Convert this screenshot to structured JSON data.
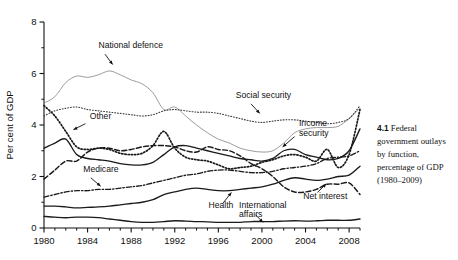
{
  "caption": {
    "number": "4.1",
    "text": "Federal government outlays by function, percentage of GDP (1980–2009)"
  },
  "chart_data": {
    "type": "line",
    "title": "",
    "xlabel": "",
    "ylabel": "Per cent of GDP",
    "xlim": [
      1980,
      2009
    ],
    "ylim": [
      0,
      8
    ],
    "grid": false,
    "legend": "inline-annotations",
    "xticks": [
      1980,
      1984,
      1988,
      1992,
      1996,
      2000,
      2004,
      2008
    ],
    "xtick_labels": [
      "1980",
      "1984",
      "1988",
      "1992",
      "1996",
      "2000",
      "2004",
      "2008"
    ],
    "xminor_ticks": [
      1981,
      1982,
      1983,
      1985,
      1986,
      1987,
      1989,
      1990,
      1991,
      1993,
      1994,
      1995,
      1997,
      1998,
      1999,
      2001,
      2002,
      2003,
      2005,
      2006,
      2007,
      2009
    ],
    "yticks": [
      0,
      2,
      4,
      6,
      8
    ],
    "ytick_labels": [
      "0",
      "2",
      "4",
      "6",
      "8"
    ],
    "yminor_ticks": [
      1,
      3,
      5,
      7
    ],
    "x": [
      1980,
      1981,
      1982,
      1983,
      1984,
      1985,
      1986,
      1987,
      1988,
      1989,
      1990,
      1991,
      1992,
      1993,
      1994,
      1995,
      1996,
      1997,
      1998,
      1999,
      2000,
      2001,
      2002,
      2003,
      2004,
      2005,
      2006,
      2007,
      2008,
      2009
    ],
    "series": [
      {
        "name": "National defence",
        "style": "solid-thin-gray",
        "color": "#8a8a8a",
        "label_x": 1985.0,
        "label_y": 7.0,
        "arrow_from": [
          1985.6,
          6.75
        ],
        "arrow_to": [
          1986.3,
          6.35
        ],
        "values": [
          4.85,
          5.1,
          5.65,
          5.9,
          5.85,
          5.95,
          6.1,
          5.95,
          5.75,
          5.6,
          5.25,
          4.6,
          4.7,
          4.35,
          4.0,
          3.7,
          3.45,
          3.3,
          3.1,
          3.0,
          2.95,
          3.0,
          3.3,
          3.7,
          3.85,
          3.9,
          3.9,
          3.95,
          4.25,
          4.65
        ]
      },
      {
        "name": "Social security",
        "style": "dotted-fine",
        "color": "#3a3a3a",
        "label_x": 1997.6,
        "label_y": 5.05,
        "arrow_from": [
          1999.0,
          4.82
        ],
        "arrow_to": [
          1999.8,
          4.45
        ],
        "values": [
          4.35,
          4.55,
          4.65,
          4.7,
          4.6,
          4.55,
          4.5,
          4.45,
          4.4,
          4.35,
          4.4,
          4.55,
          4.6,
          4.55,
          4.5,
          4.5,
          4.45,
          4.35,
          4.25,
          4.15,
          4.1,
          4.15,
          4.2,
          4.2,
          4.15,
          4.1,
          4.05,
          4.1,
          4.25,
          4.75
        ]
      },
      {
        "name": "Other",
        "style": "dotted-coarse",
        "color": "#1a1a1a",
        "label_x": 1984.2,
        "label_y": 4.25,
        "arrow_from": [
          1983.8,
          4.05
        ],
        "arrow_to": [
          1982.7,
          3.82
        ],
        "values": [
          4.75,
          4.35,
          3.75,
          3.15,
          3.05,
          3.1,
          3.05,
          2.9,
          2.85,
          2.9,
          3.2,
          3.75,
          3.1,
          2.75,
          2.65,
          2.6,
          2.45,
          2.3,
          2.35,
          2.4,
          2.55,
          2.65,
          2.8,
          2.85,
          2.75,
          2.6,
          3.05,
          2.35,
          2.85,
          4.6
        ]
      },
      {
        "name": "Income security",
        "style": "solid-medium",
        "color": "#1a1a1a",
        "label_x": 2003.4,
        "label_y": 3.95,
        "arrow_from": [
          2003.0,
          3.55
        ],
        "arrow_to": [
          2001.9,
          3.15
        ],
        "values": [
          3.1,
          3.3,
          3.45,
          2.85,
          2.7,
          2.65,
          2.6,
          2.5,
          2.45,
          2.45,
          2.55,
          2.85,
          3.15,
          3.2,
          3.1,
          3.0,
          2.9,
          2.8,
          2.7,
          2.65,
          2.6,
          2.7,
          3.0,
          3.05,
          2.85,
          2.75,
          2.65,
          2.7,
          3.0,
          3.85
        ]
      },
      {
        "name": "Medicare",
        "style": "dash-dot",
        "color": "#1a1a1a",
        "label_x": 1983.6,
        "label_y": 2.18,
        "arrow_from": [
          1984.3,
          1.95
        ],
        "arrow_to": [
          1985.2,
          1.62
        ],
        "values": [
          1.2,
          1.3,
          1.4,
          1.45,
          1.45,
          1.5,
          1.5,
          1.55,
          1.6,
          1.65,
          1.75,
          1.85,
          1.95,
          2.05,
          2.1,
          2.2,
          2.25,
          2.25,
          2.2,
          2.15,
          2.15,
          2.2,
          2.3,
          2.35,
          2.4,
          2.5,
          2.7,
          2.75,
          2.8,
          3.0
        ]
      },
      {
        "name": "Net interest",
        "style": "dashed",
        "color": "#1a1a1a",
        "label_x": 2003.8,
        "label_y": 1.12,
        "arrow_from": [
          2005.1,
          1.38
        ],
        "arrow_to": [
          2005.9,
          1.72
        ],
        "values": [
          1.9,
          2.25,
          2.6,
          2.6,
          2.95,
          3.1,
          3.1,
          3.0,
          3.05,
          3.15,
          3.2,
          3.2,
          3.15,
          3.0,
          2.95,
          3.15,
          3.05,
          3.0,
          2.8,
          2.5,
          2.3,
          2.0,
          1.6,
          1.4,
          1.4,
          1.5,
          1.7,
          1.7,
          1.75,
          1.3
        ]
      },
      {
        "name": "Health",
        "style": "solid-medium",
        "color": "#1a1a1a",
        "label_x": 1995.1,
        "label_y": 0.78,
        "arrow_from": [
          1996.4,
          0.95
        ],
        "arrow_to": [
          1997.2,
          1.38
        ],
        "values": [
          0.85,
          0.85,
          0.82,
          0.78,
          0.8,
          0.82,
          0.85,
          0.9,
          0.95,
          1.0,
          1.1,
          1.3,
          1.4,
          1.5,
          1.55,
          1.5,
          1.45,
          1.45,
          1.5,
          1.55,
          1.6,
          1.7,
          1.85,
          1.95,
          1.9,
          1.85,
          1.9,
          2.0,
          2.05,
          2.4
        ]
      },
      {
        "name": "International affairs",
        "style": "solid-medium",
        "color": "#1a1a1a",
        "label_x": 1997.9,
        "label_y": 0.78,
        "arrow_from": [
          1999.4,
          0.52
        ],
        "arrow_to": [
          2000.1,
          0.22
        ],
        "values": [
          0.45,
          0.42,
          0.4,
          0.42,
          0.42,
          0.4,
          0.35,
          0.3,
          0.25,
          0.22,
          0.22,
          0.25,
          0.28,
          0.27,
          0.25,
          0.24,
          0.22,
          0.22,
          0.22,
          0.25,
          0.25,
          0.25,
          0.27,
          0.28,
          0.27,
          0.28,
          0.3,
          0.3,
          0.3,
          0.35
        ]
      }
    ]
  }
}
